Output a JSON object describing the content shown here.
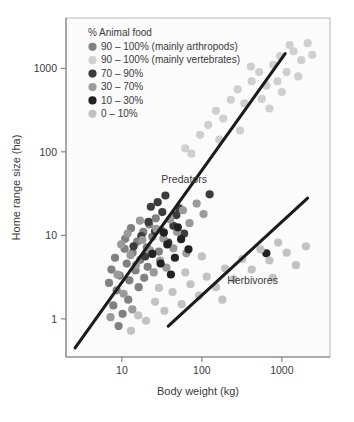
{
  "chart_data": {
    "type": "scatter",
    "title": "",
    "xlabel": "Body weight (kg)",
    "ylabel": "Home range size (ha)",
    "xscale": "log",
    "yscale": "log",
    "xlim": [
      2,
      4000
    ],
    "ylim": [
      0.35,
      4000
    ],
    "xticks": [
      10,
      100,
      1000
    ],
    "xtick_labels": [
      "10",
      "100",
      "1000"
    ],
    "yticks": [
      1,
      10,
      100,
      1000
    ],
    "ytick_labels": [
      "1",
      "10",
      "100",
      "1000"
    ],
    "grid": false,
    "legend": {
      "title": "% Animal food",
      "position": "top-left-inside",
      "entries": [
        {
          "label": "90 – 100% (mainly arthropods)",
          "color": "#808080",
          "key": "arthropods"
        },
        {
          "label": "90 – 100% (mainly vertebrates)",
          "color": "#cfcfcf",
          "key": "vertebrates"
        },
        {
          "label": "70 – 90%",
          "color": "#3c3c3c",
          "key": "p70_90"
        },
        {
          "label": "30 – 70%",
          "color": "#9a9a9a",
          "key": "p30_70"
        },
        {
          "label": "10 – 30%",
          "color": "#222222",
          "key": "p10_30"
        },
        {
          "label": "0 – 10%",
          "color": "#c2c2c2",
          "key": "p0_10"
        }
      ]
    },
    "annotations": [
      {
        "text": "Predators",
        "x": 60,
        "y": 42
      },
      {
        "text": "Herbivores",
        "x": 430,
        "y": 2.6
      }
    ],
    "trend_lines": [
      {
        "name": "Predators",
        "x": [
          2.6,
          1100
        ],
        "y": [
          0.45,
          1500
        ]
      },
      {
        "name": "Herbivores",
        "x": [
          38,
          2100
        ],
        "y": [
          0.82,
          28
        ]
      }
    ],
    "series": [
      {
        "name": "90 – 100% (mainly arthropods)",
        "color": "#808080",
        "points": [
          [
            7.8,
            1.45
          ],
          [
            8.6,
            2.2
          ],
          [
            9.4,
            3.3
          ],
          [
            10.2,
            1.15
          ],
          [
            11.5,
            4.6
          ],
          [
            12.4,
            2.9
          ],
          [
            13.6,
            6.2
          ],
          [
            14.8,
            3.8
          ],
          [
            9.1,
            0.82
          ],
          [
            10.8,
            6.9
          ],
          [
            12.0,
            1.7
          ],
          [
            15.5,
            8.4
          ],
          [
            17.0,
            5.1
          ],
          [
            18.5,
            11.0
          ],
          [
            20.5,
            7.2
          ],
          [
            22.0,
            13.5
          ],
          [
            8.2,
            5.4
          ],
          [
            11.0,
            9.1
          ],
          [
            13.0,
            12.2
          ],
          [
            16.2,
            2.4
          ],
          [
            19.0,
            3.1
          ],
          [
            24.0,
            9.6
          ],
          [
            26.5,
            16.0
          ],
          [
            29.0,
            6.4
          ],
          [
            6.9,
            2.7
          ],
          [
            7.4,
            3.9
          ],
          [
            21.0,
            4.2
          ],
          [
            31.0,
            11.5
          ]
        ]
      },
      {
        "name": "90 – 100% (mainly vertebrates)",
        "color": "#cfcfcf",
        "points": [
          [
            95,
            160
          ],
          [
            120,
            210
          ],
          [
            150,
            310
          ],
          [
            185,
            250
          ],
          [
            230,
            420
          ],
          [
            280,
            560
          ],
          [
            340,
            380
          ],
          [
            420,
            700
          ],
          [
            520,
            900
          ],
          [
            640,
            620
          ],
          [
            780,
            1100
          ],
          [
            950,
            1400
          ],
          [
            1150,
            900
          ],
          [
            1400,
            1600
          ],
          [
            1750,
            1250
          ],
          [
            2100,
            2000
          ],
          [
            62,
            110
          ],
          [
            74,
            95
          ],
          [
            165,
            140
          ],
          [
            300,
            180
          ],
          [
            560,
            430
          ],
          [
            880,
            700
          ],
          [
            1250,
            1900
          ],
          [
            1600,
            800
          ],
          [
            2400,
            1450
          ],
          [
            410,
            1050
          ],
          [
            700,
            330
          ],
          [
            1000,
            520
          ]
        ]
      },
      {
        "name": "70 – 90%",
        "color": "#3c3c3c",
        "points": [
          [
            14.0,
            7.4
          ],
          [
            17.5,
            9.8
          ],
          [
            21.5,
            14.5
          ],
          [
            26.0,
            11.2
          ],
          [
            32.0,
            19.0
          ],
          [
            38.0,
            8.2
          ],
          [
            44.0,
            13.0
          ],
          [
            52.0,
            21.0
          ],
          [
            19.5,
            5.6
          ],
          [
            28.0,
            25.0
          ],
          [
            35.0,
            30.0
          ],
          [
            48.0,
            17.5
          ],
          [
            125,
            31.0
          ],
          [
            60.0,
            10.5
          ],
          [
            23.0,
            22.0
          ]
        ]
      },
      {
        "name": "30 – 70%",
        "color": "#9a9a9a",
        "points": [
          [
            8.8,
            3.4
          ],
          [
            10.5,
            2.0
          ],
          [
            12.8,
            5.8
          ],
          [
            15.0,
            4.4
          ],
          [
            18.0,
            8.8
          ],
          [
            22.5,
            6.6
          ],
          [
            27.0,
            12.0
          ],
          [
            33.0,
            9.2
          ],
          [
            40.0,
            15.5
          ],
          [
            49.0,
            11.0
          ],
          [
            58.0,
            20.0
          ],
          [
            70.0,
            14.0
          ],
          [
            9.8,
            7.8
          ],
          [
            13.5,
            1.3
          ],
          [
            16.8,
            15.0
          ],
          [
            25.0,
            3.6
          ],
          [
            30.0,
            5.0
          ],
          [
            44.0,
            7.0
          ],
          [
            86.0,
            24.0
          ],
          [
            105,
            18.0
          ],
          [
            7.2,
            1.05
          ],
          [
            11.8,
            10.5
          ],
          [
            36.0,
            4.1
          ],
          [
            64.0,
            6.1
          ]
        ]
      },
      {
        "name": "10 – 30%",
        "color": "#222222",
        "points": [
          [
            24.0,
            6.0
          ],
          [
            30.5,
            4.6
          ],
          [
            37.0,
            7.8
          ],
          [
            46.0,
            5.4
          ],
          [
            55.0,
            9.0
          ],
          [
            68.0,
            6.8
          ],
          [
            41.0,
            3.4
          ],
          [
            33.5,
            10.8
          ],
          [
            640,
            6.1
          ],
          [
            50.0,
            12.5
          ]
        ]
      },
      {
        "name": "0 – 10%",
        "color": "#c2c2c2",
        "points": [
          [
            13.0,
            0.72
          ],
          [
            16.0,
            1.1
          ],
          [
            20.0,
            0.95
          ],
          [
            26.0,
            1.6
          ],
          [
            34.0,
            1.25
          ],
          [
            43.0,
            2.1
          ],
          [
            56.0,
            1.5
          ],
          [
            72.0,
            2.6
          ],
          [
            92.0,
            1.9
          ],
          [
            115,
            3.2
          ],
          [
            150,
            2.4
          ],
          [
            195,
            4.0
          ],
          [
            250,
            3.0
          ],
          [
            320,
            5.2
          ],
          [
            420,
            3.9
          ],
          [
            540,
            6.8
          ],
          [
            700,
            5.0
          ],
          [
            900,
            8.2
          ],
          [
            1150,
            6.2
          ],
          [
            1500,
            4.4
          ],
          [
            180,
            1.7
          ],
          [
            100,
            5.6
          ],
          [
            62.0,
            3.6
          ],
          [
            29.0,
            2.35
          ],
          [
            770,
            3.1
          ],
          [
            2000,
            7.4
          ]
        ]
      }
    ]
  }
}
